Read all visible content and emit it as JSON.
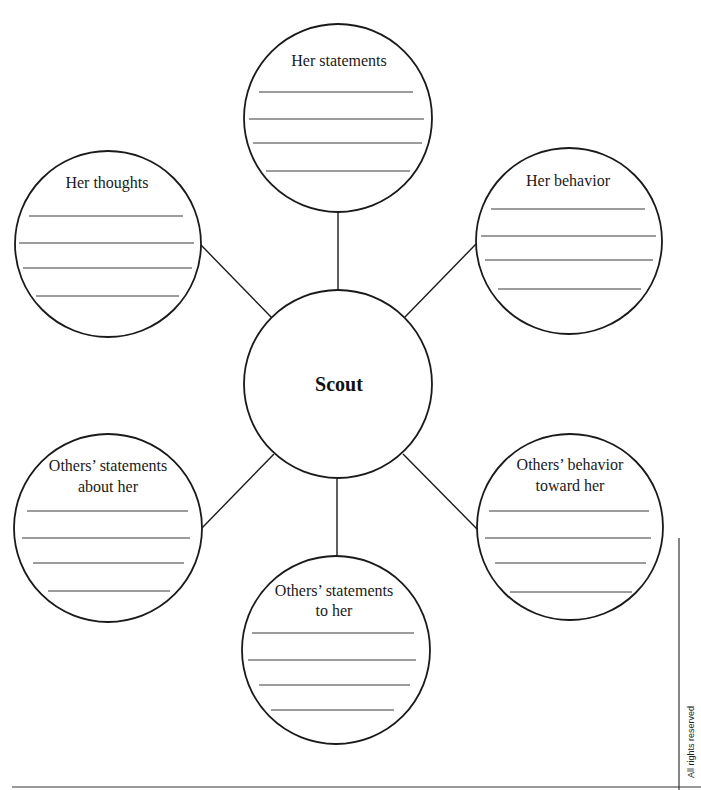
{
  "diagram": {
    "center": {
      "label": "Scout"
    },
    "nodes": [
      {
        "id": "her-statements",
        "title_lines": [
          "Her statements"
        ]
      },
      {
        "id": "her-thoughts",
        "title_lines": [
          "Her thoughts"
        ]
      },
      {
        "id": "her-behavior",
        "title_lines": [
          "Her behavior"
        ]
      },
      {
        "id": "others-statements-about-her",
        "title_lines": [
          "Others’ statements",
          "about her"
        ]
      },
      {
        "id": "others-behavior-toward-her",
        "title_lines": [
          "Others’ behavior",
          "toward her"
        ]
      },
      {
        "id": "others-statements-to-her",
        "title_lines": [
          "Others’ statements",
          "to her"
        ]
      }
    ],
    "writing_lines_per_node": 4
  },
  "footer": {
    "rights_text": "All rights reserved"
  }
}
